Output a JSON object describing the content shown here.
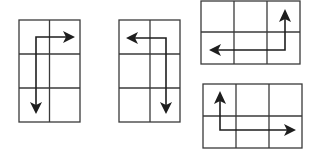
{
  "diagram": {
    "colors": {
      "grid": "#3a3a3a",
      "arrow": "#1e1e1e",
      "background": "#ffffff"
    },
    "panels": [
      {
        "id": "panel-1",
        "rows": 3,
        "cols": 2,
        "box": [
          19,
          20,
          80,
          122
        ],
        "arrow": {
          "start_dir": "right",
          "path": [
            [
              74,
              37
            ],
            [
              36,
              37
            ],
            [
              36,
              113
            ]
          ],
          "heads": [
            "right",
            "down"
          ]
        }
      },
      {
        "id": "panel-2",
        "rows": 3,
        "cols": 2,
        "box": [
          119,
          20,
          180,
          122
        ],
        "arrow": {
          "path": [
            [
              127,
              38
            ],
            [
              166,
              38
            ],
            [
              166,
              113
            ]
          ],
          "heads": [
            "left",
            "down"
          ]
        }
      },
      {
        "id": "panel-3",
        "rows": 2,
        "cols": 3,
        "box": [
          201,
          1,
          300,
          64
        ],
        "arrow": {
          "path": [
            [
              285,
              9
            ],
            [
              285,
              50
            ],
            [
              210,
              50
            ]
          ],
          "heads": [
            "up",
            "left"
          ]
        }
      },
      {
        "id": "panel-4",
        "rows": 2,
        "cols": 3,
        "box": [
          203,
          84,
          302,
          148
        ],
        "arrow": {
          "path": [
            [
              220,
              91
            ],
            [
              220,
              130
            ],
            [
              295,
              130
            ]
          ],
          "heads": [
            "up",
            "right"
          ]
        }
      }
    ]
  }
}
